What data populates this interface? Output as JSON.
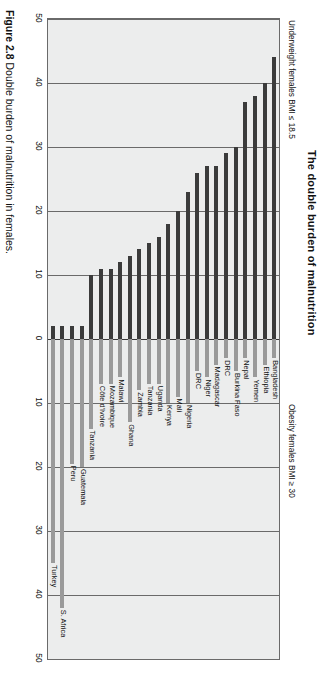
{
  "figure": {
    "number": "Figure 2.8",
    "caption": "Double burden of malnutrition in females."
  },
  "chart_data": {
    "type": "bar",
    "title": "The double burden of malnutrition",
    "orientation": "horizontal-diverging",
    "left_axis_label": "Underweight females BMI ≤ 18.5",
    "right_axis_label": "Obesity females BMI ≥ 30",
    "xlabel": "",
    "ylabel": "",
    "xlim": [
      -50,
      50
    ],
    "axis_ticks": [
      {
        "label": "50",
        "value": -50
      },
      {
        "label": "40",
        "value": -40
      },
      {
        "label": "30",
        "value": -30
      },
      {
        "label": "20",
        "value": -20
      },
      {
        "label": "10",
        "value": -10
      },
      {
        "label": "0",
        "value": 0
      },
      {
        "label": "10",
        "value": 10
      },
      {
        "label": "20",
        "value": 20
      },
      {
        "label": "30",
        "value": 30
      },
      {
        "label": "40",
        "value": 40
      },
      {
        "label": "50",
        "value": 50
      }
    ],
    "grid": true,
    "gridlines": [
      -50,
      -40,
      -30,
      -20,
      -10,
      0,
      10,
      20,
      30,
      40,
      50
    ],
    "legend": [],
    "series": [
      {
        "name": "Underweight females BMI ≤ 18.5",
        "color": "#3b3b3b"
      },
      {
        "name": "Obesity females BMI ≥ 30",
        "color": "#9a9a9a"
      }
    ],
    "categories": [
      "Bangladesh",
      "Ethiopia",
      "Yemen",
      "Nepal",
      "Burkina Faso",
      "DRC",
      "Madagascar",
      "Niger",
      "DRC",
      "Nigeria",
      "Mali",
      "Kenya",
      "Uganda",
      "Tanzania",
      "Zambia",
      "Ghana",
      "Malawi",
      "Mozambique",
      "Côte d'Ivoire",
      "Tanzania",
      "Guatemala",
      "Peru",
      "S. Africa",
      "Turkey"
    ],
    "underweight_values": [
      44,
      40,
      38,
      37,
      30,
      29,
      27,
      27,
      26,
      23,
      20,
      18,
      16,
      15,
      14,
      13,
      12,
      11,
      11,
      10,
      2,
      2,
      2,
      2
    ],
    "obesity_values": [
      3,
      4,
      6,
      3,
      5,
      3,
      4,
      6,
      5,
      10,
      9,
      10,
      7,
      7,
      8,
      13,
      6,
      7,
      7,
      14,
      20,
      19.5,
      42,
      35
    ]
  }
}
